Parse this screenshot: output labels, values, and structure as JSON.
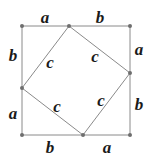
{
  "diagram": {
    "title": "",
    "colors": {
      "line": "#8a8a8a",
      "vertex": "#6e6e6e",
      "label": "#1a1a1a",
      "background": "#ffffff"
    },
    "outer_square": {
      "vertices": [
        {
          "name": "top-left",
          "x": 22,
          "y": 26
        },
        {
          "name": "top-right",
          "x": 130,
          "y": 26
        },
        {
          "name": "bottom-right",
          "x": 130,
          "y": 135
        },
        {
          "name": "bottom-left",
          "x": 22,
          "y": 135
        }
      ]
    },
    "inner_square": {
      "vertices": [
        {
          "name": "top",
          "x": 69,
          "y": 26
        },
        {
          "name": "right",
          "x": 130,
          "y": 73
        },
        {
          "name": "bottom",
          "x": 83,
          "y": 135
        },
        {
          "name": "left",
          "x": 22,
          "y": 88
        }
      ]
    },
    "labels": {
      "top_a": "a",
      "top_b": "b",
      "right_a": "a",
      "right_b": "b",
      "bottom_b": "b",
      "bottom_a": "a",
      "left_b": "b",
      "left_a": "a",
      "inner_top_left_c": "c",
      "inner_top_right_c": "c",
      "inner_bottom_left_c": "c",
      "inner_bottom_right_c": "c"
    }
  }
}
